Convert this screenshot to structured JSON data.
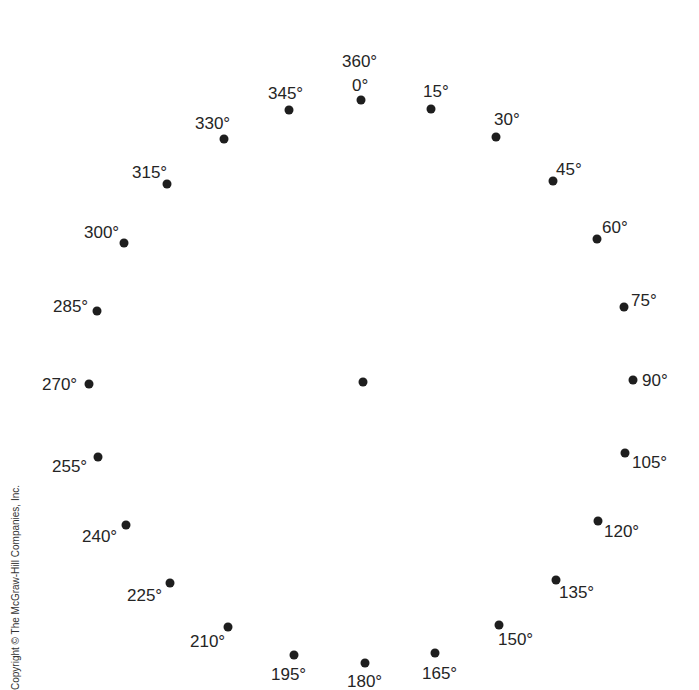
{
  "diagram": {
    "center_dot": {
      "x": 363,
      "y": 382
    },
    "points": [
      {
        "label": "0°",
        "extra_label": "360°",
        "x": 361,
        "y": 100,
        "lx": 352,
        "ly": 77
      },
      {
        "label": "15°",
        "x": 431,
        "y": 109,
        "lx": 423,
        "ly": 83
      },
      {
        "label": "30°",
        "x": 496,
        "y": 137,
        "lx": 494,
        "ly": 111
      },
      {
        "label": "45°",
        "x": 553,
        "y": 181,
        "lx": 556,
        "ly": 161
      },
      {
        "label": "60°",
        "x": 597,
        "y": 239,
        "lx": 602,
        "ly": 219
      },
      {
        "label": "75°",
        "x": 624,
        "y": 307,
        "lx": 631,
        "ly": 292
      },
      {
        "label": "90°",
        "x": 633,
        "y": 380,
        "lx": 642,
        "ly": 372
      },
      {
        "label": "105°",
        "x": 625,
        "y": 453,
        "lx": 632,
        "ly": 454
      },
      {
        "label": "120°",
        "x": 598,
        "y": 521,
        "lx": 604,
        "ly": 523
      },
      {
        "label": "135°",
        "x": 556,
        "y": 580,
        "lx": 559,
        "ly": 584
      },
      {
        "label": "150°",
        "x": 499,
        "y": 625,
        "lx": 498,
        "ly": 631
      },
      {
        "label": "165°",
        "x": 435,
        "y": 653,
        "lx": 422,
        "ly": 665
      },
      {
        "label": "180°",
        "x": 365,
        "y": 663,
        "lx": 347,
        "ly": 673
      },
      {
        "label": "195°",
        "x": 294,
        "y": 655,
        "lx": 271,
        "ly": 666
      },
      {
        "label": "210°",
        "x": 228,
        "y": 627,
        "lx": 190,
        "ly": 633
      },
      {
        "label": "225°",
        "x": 170,
        "y": 583,
        "lx": 127,
        "ly": 587
      },
      {
        "label": "240°",
        "x": 126,
        "y": 525,
        "lx": 82,
        "ly": 528
      },
      {
        "label": "255°",
        "x": 98,
        "y": 457,
        "lx": 52,
        "ly": 458
      },
      {
        "label": "270°",
        "x": 89,
        "y": 384,
        "lx": 42,
        "ly": 376
      },
      {
        "label": "285°",
        "x": 97,
        "y": 311,
        "lx": 53,
        "ly": 298
      },
      {
        "label": "300°",
        "x": 124,
        "y": 243,
        "lx": 84,
        "ly": 224
      },
      {
        "label": "315°",
        "x": 167,
        "y": 184,
        "lx": 132,
        "ly": 164
      },
      {
        "label": "330°",
        "x": 224,
        "y": 139,
        "lx": 195,
        "ly": 115
      },
      {
        "label": "345°",
        "x": 289,
        "y": 110,
        "lx": 268,
        "ly": 85
      }
    ],
    "top_extra_label_pos": {
      "lx": 342,
      "ly": 53
    }
  },
  "footer": {
    "copyright": "Copyright © The McGraw-Hill Companies, Inc."
  },
  "colors": {
    "dot": "#1e1e1e",
    "text": "#252525",
    "background": "#ffffff"
  }
}
